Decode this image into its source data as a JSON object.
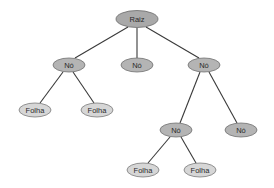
{
  "diagram": {
    "type": "tree",
    "nodes": [
      {
        "id": "root",
        "label": "Raiz",
        "kind": "root",
        "x": 137,
        "y": 19,
        "rx": 21,
        "ry": 8.5
      },
      {
        "id": "n1",
        "label": "Nó",
        "kind": "internal",
        "x": 69,
        "y": 65,
        "rx": 16,
        "ry": 7
      },
      {
        "id": "n2",
        "label": "Nó",
        "kind": "internal",
        "x": 137,
        "y": 65,
        "rx": 16,
        "ry": 7
      },
      {
        "id": "n3",
        "label": "Nó",
        "kind": "internal",
        "x": 204,
        "y": 65,
        "rx": 16,
        "ry": 7
      },
      {
        "id": "f1",
        "label": "Folha",
        "kind": "leaf",
        "x": 35,
        "y": 110,
        "rx": 16,
        "ry": 7
      },
      {
        "id": "f2",
        "label": "Folha",
        "kind": "leaf",
        "x": 97,
        "y": 110,
        "rx": 16,
        "ry": 7
      },
      {
        "id": "n4",
        "label": "Nó",
        "kind": "internal",
        "x": 176,
        "y": 130,
        "rx": 16,
        "ry": 7
      },
      {
        "id": "n5",
        "label": "Nó",
        "kind": "internal",
        "x": 241,
        "y": 130,
        "rx": 16,
        "ry": 7
      },
      {
        "id": "f3",
        "label": "Folha",
        "kind": "leaf",
        "x": 143,
        "y": 170,
        "rx": 16,
        "ry": 7
      },
      {
        "id": "f4",
        "label": "Folha",
        "kind": "leaf",
        "x": 200,
        "y": 170,
        "rx": 16,
        "ry": 7
      }
    ],
    "edges": [
      {
        "from": "root",
        "to": "n1",
        "x1": 128,
        "y1": 27,
        "x2": 75,
        "y2": 58
      },
      {
        "from": "root",
        "to": "n2",
        "x1": 137,
        "y1": 28,
        "x2": 137,
        "y2": 58
      },
      {
        "from": "root",
        "to": "n3",
        "x1": 146,
        "y1": 27,
        "x2": 199,
        "y2": 58
      },
      {
        "from": "n1",
        "to": "f1",
        "x1": 63,
        "y1": 72,
        "x2": 40,
        "y2": 103
      },
      {
        "from": "n1",
        "to": "f2",
        "x1": 73,
        "y1": 72,
        "x2": 94,
        "y2": 103
      },
      {
        "from": "n3",
        "to": "n4",
        "x1": 200,
        "y1": 72,
        "x2": 180,
        "y2": 123
      },
      {
        "from": "n3",
        "to": "n5",
        "x1": 209,
        "y1": 72,
        "x2": 237,
        "y2": 123
      },
      {
        "from": "n4",
        "to": "f3",
        "x1": 170,
        "y1": 137,
        "x2": 148,
        "y2": 163
      },
      {
        "from": "n4",
        "to": "f4",
        "x1": 181,
        "y1": 137,
        "x2": 196,
        "y2": 163
      }
    ],
    "colors": {
      "root_fill": "#a9a9a9",
      "internal_fill": "#b4b4b4",
      "leaf_fill": "#d6d6d6",
      "edge": "#3a3a3a"
    }
  }
}
